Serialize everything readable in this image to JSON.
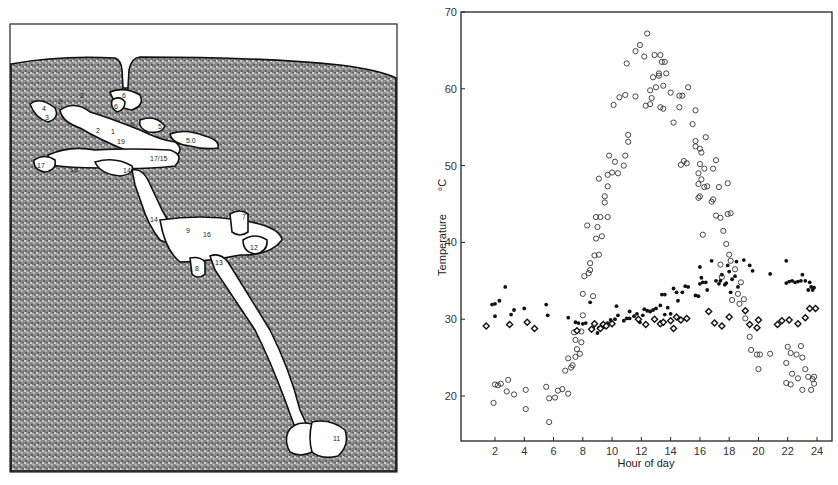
{
  "figure": {
    "left_panel": {
      "type": "burrow-diagram",
      "description": "Cross-section drawing of a burrow/nest system in soil with numbered chambers",
      "chamber_labels": [
        "1",
        "2",
        "2",
        "3",
        "3",
        "4",
        "5",
        "5.0",
        "6",
        "6",
        "6",
        "7",
        "8",
        "9",
        "11",
        "12",
        "13",
        "14",
        "14",
        "16",
        "17",
        "17/15",
        "18",
        "19"
      ]
    },
    "right_panel": {
      "type": "scatter"
    }
  },
  "chart_data": {
    "type": "scatter",
    "title": "",
    "xlabel": "Hour of day",
    "ylabel": "Temperature",
    "ylabel_unit": "°C",
    "xticks": [
      2,
      4,
      6,
      8,
      10,
      12,
      14,
      16,
      18,
      20,
      22,
      24
    ],
    "yticks": [
      20,
      30,
      40,
      50,
      60,
      70
    ],
    "xlim": [
      0.5,
      25
    ],
    "ylim": [
      15,
      70
    ],
    "grid": false,
    "legend": "none",
    "series": [
      {
        "name": "open circles (surface temperature)",
        "marker": "open-circle",
        "points": [
          [
            1.9,
            19.1
          ],
          [
            2.0,
            21.5
          ],
          [
            2.2,
            21.4
          ],
          [
            2.4,
            21.6
          ],
          [
            2.8,
            20.6
          ],
          [
            2.9,
            22.1
          ],
          [
            3.3,
            20.2
          ],
          [
            4.1,
            20.8
          ],
          [
            4.1,
            18.3
          ],
          [
            5.5,
            21.2
          ],
          [
            5.7,
            16.6
          ],
          [
            5.7,
            19.7
          ],
          [
            6.1,
            19.8
          ],
          [
            6.3,
            20.7
          ],
          [
            6.6,
            20.9
          ],
          [
            7.0,
            20.3
          ],
          [
            6.8,
            23.3
          ],
          [
            7.0,
            24.9
          ],
          [
            7.2,
            23.7
          ],
          [
            7.3,
            24.0
          ],
          [
            7.4,
            28.3
          ],
          [
            7.5,
            27.3
          ],
          [
            7.5,
            25.1
          ],
          [
            7.6,
            26.1
          ],
          [
            7.8,
            25.5
          ],
          [
            7.9,
            27.0
          ],
          [
            7.9,
            28.4
          ],
          [
            8.0,
            30.5
          ],
          [
            8.0,
            33.3
          ],
          [
            8.1,
            35.6
          ],
          [
            8.3,
            42.2
          ],
          [
            8.4,
            36.0
          ],
          [
            8.5,
            36.4
          ],
          [
            8.5,
            37.3
          ],
          [
            8.7,
            33.0
          ],
          [
            8.8,
            38.3
          ],
          [
            8.9,
            40.5
          ],
          [
            8.9,
            43.3
          ],
          [
            9.0,
            42.0
          ],
          [
            9.1,
            38.4
          ],
          [
            9.1,
            48.3
          ],
          [
            9.2,
            43.3
          ],
          [
            9.3,
            40.8
          ],
          [
            9.5,
            46.0
          ],
          [
            9.5,
            45.2
          ],
          [
            9.7,
            43.3
          ],
          [
            9.7,
            47.3
          ],
          [
            9.7,
            48.8
          ],
          [
            9.8,
            51.3
          ],
          [
            10.0,
            49.1
          ],
          [
            10.1,
            57.9
          ],
          [
            10.2,
            50.5
          ],
          [
            10.4,
            49.0
          ],
          [
            10.5,
            58.9
          ],
          [
            10.8,
            50.0
          ],
          [
            10.9,
            51.3
          ],
          [
            10.9,
            59.2
          ],
          [
            11.0,
            63.3
          ],
          [
            11.1,
            54.0
          ],
          [
            11.1,
            53.1
          ],
          [
            11.6,
            59.0
          ],
          [
            11.6,
            64.9
          ],
          [
            11.9,
            65.7
          ],
          [
            12.2,
            64.2
          ],
          [
            12.3,
            57.8
          ],
          [
            12.4,
            67.2
          ],
          [
            12.6,
            58.0
          ],
          [
            12.6,
            59.8
          ],
          [
            12.7,
            58.8
          ],
          [
            12.8,
            61.5
          ],
          [
            12.9,
            64.4
          ],
          [
            13.0,
            60.2
          ],
          [
            13.2,
            61.7
          ],
          [
            13.2,
            62.0
          ],
          [
            13.3,
            64.4
          ],
          [
            13.3,
            57.6
          ],
          [
            13.4,
            63.5
          ],
          [
            13.5,
            60.4
          ],
          [
            13.5,
            57.4
          ],
          [
            13.6,
            63.5
          ],
          [
            13.7,
            62.0
          ],
          [
            14.0,
            59.5
          ],
          [
            14.2,
            55.6
          ],
          [
            14.6,
            59.1
          ],
          [
            14.6,
            57.6
          ],
          [
            14.7,
            50.1
          ],
          [
            14.8,
            59.1
          ],
          [
            14.9,
            50.6
          ],
          [
            15.1,
            50.3
          ],
          [
            15.2,
            60.2
          ],
          [
            15.5,
            55.4
          ],
          [
            15.7,
            57.2
          ],
          [
            15.7,
            53.2
          ],
          [
            15.7,
            52.5
          ],
          [
            15.9,
            49.0
          ],
          [
            15.9,
            47.6
          ],
          [
            15.9,
            45.8
          ],
          [
            16.0,
            50.2
          ],
          [
            16.0,
            52.2
          ],
          [
            16.0,
            46.0
          ],
          [
            16.1,
            48.2
          ],
          [
            16.1,
            51.7
          ],
          [
            16.2,
            41.0
          ],
          [
            16.3,
            49.6
          ],
          [
            16.3,
            47.2
          ],
          [
            16.4,
            53.7
          ],
          [
            16.5,
            47.3
          ],
          [
            16.8,
            45.3
          ],
          [
            16.9,
            49.6
          ],
          [
            16.9,
            45.6
          ],
          [
            17.1,
            50.7
          ],
          [
            17.1,
            43.5
          ],
          [
            17.3,
            47.2
          ],
          [
            17.4,
            43.2
          ],
          [
            17.4,
            37.1
          ],
          [
            17.5,
            35.5
          ],
          [
            17.6,
            41.5
          ],
          [
            17.8,
            39.8
          ],
          [
            17.9,
            47.7
          ],
          [
            17.9,
            43.7
          ],
          [
            18.0,
            38.4
          ],
          [
            18.1,
            43.8
          ],
          [
            18.1,
            37.6
          ],
          [
            18.2,
            32.5
          ],
          [
            18.4,
            36.5
          ],
          [
            18.6,
            33.3
          ],
          [
            18.7,
            32.0
          ],
          [
            18.8,
            34.8
          ],
          [
            19.0,
            32.6
          ],
          [
            19.1,
            30.1
          ],
          [
            19.4,
            27.7
          ],
          [
            19.5,
            26.0
          ],
          [
            19.9,
            25.4
          ],
          [
            20.0,
            23.5
          ],
          [
            20.1,
            25.4
          ],
          [
            20.8,
            25.5
          ],
          [
            21.9,
            24.3
          ],
          [
            21.9,
            21.7
          ],
          [
            22.0,
            26.4
          ],
          [
            22.2,
            25.6
          ],
          [
            22.2,
            21.5
          ],
          [
            22.3,
            22.9
          ],
          [
            22.6,
            25.4
          ],
          [
            22.7,
            22.3
          ],
          [
            22.9,
            26.5
          ],
          [
            23.0,
            25.0
          ],
          [
            23.0,
            20.8
          ],
          [
            23.2,
            23.5
          ],
          [
            23.4,
            22.5
          ],
          [
            23.6,
            20.8
          ],
          [
            23.7,
            22.2
          ],
          [
            23.8,
            22.5
          ],
          [
            23.8,
            21.6
          ]
        ]
      },
      {
        "name": "filled dots (burrow temperature, upper)",
        "marker": "filled-dot",
        "points": [
          [
            1.8,
            31.9
          ],
          [
            2.0,
            32.0
          ],
          [
            2.0,
            30.4
          ],
          [
            2.3,
            32.4
          ],
          [
            2.7,
            34.2
          ],
          [
            3.1,
            30.6
          ],
          [
            3.3,
            31.2
          ],
          [
            4.0,
            31.4
          ],
          [
            5.5,
            31.9
          ],
          [
            5.6,
            30.5
          ],
          [
            7.0,
            30.2
          ],
          [
            7.5,
            29.6
          ],
          [
            7.7,
            29.5
          ],
          [
            8.0,
            29.4
          ],
          [
            8.2,
            29.5
          ],
          [
            8.5,
            32.2
          ],
          [
            8.7,
            28.8
          ],
          [
            9.0,
            28.2
          ],
          [
            9.1,
            28.9
          ],
          [
            9.3,
            29.3
          ],
          [
            9.5,
            29.0
          ],
          [
            9.7,
            29.5
          ],
          [
            9.9,
            29.9
          ],
          [
            10.2,
            30.0
          ],
          [
            10.3,
            31.7
          ],
          [
            10.4,
            30.5
          ],
          [
            10.8,
            29.8
          ],
          [
            11.0,
            30.1
          ],
          [
            11.2,
            30.1
          ],
          [
            11.2,
            31.0
          ],
          [
            11.5,
            30.4
          ],
          [
            11.7,
            30.7
          ],
          [
            11.9,
            29.6
          ],
          [
            12.1,
            30.5
          ],
          [
            12.2,
            31.3
          ],
          [
            12.4,
            31.1
          ],
          [
            12.6,
            31.0
          ],
          [
            12.8,
            31.2
          ],
          [
            13.0,
            31.4
          ],
          [
            13.3,
            31.8
          ],
          [
            13.4,
            33.2
          ],
          [
            13.6,
            33.2
          ],
          [
            13.6,
            30.6
          ],
          [
            13.8,
            31.5
          ],
          [
            14.0,
            30.7
          ],
          [
            14.2,
            34.0
          ],
          [
            14.4,
            33.5
          ],
          [
            14.5,
            32.4
          ],
          [
            14.8,
            33.5
          ],
          [
            15.0,
            34.3
          ],
          [
            15.2,
            34.2
          ],
          [
            15.7,
            33.1
          ],
          [
            15.9,
            33.0
          ],
          [
            16.0,
            36.8
          ],
          [
            16.0,
            34.6
          ],
          [
            16.1,
            35.4
          ],
          [
            16.2,
            34.8
          ],
          [
            16.4,
            34.8
          ],
          [
            16.5,
            33.8
          ],
          [
            16.8,
            37.6
          ],
          [
            17.1,
            35.0
          ],
          [
            17.3,
            34.6
          ],
          [
            17.4,
            35.0
          ],
          [
            17.5,
            35.8
          ],
          [
            17.7,
            34.5
          ],
          [
            17.8,
            34.7
          ],
          [
            17.9,
            37.0
          ],
          [
            18.0,
            36.2
          ],
          [
            18.1,
            33.5
          ],
          [
            18.2,
            35.2
          ],
          [
            18.4,
            35.6
          ],
          [
            18.5,
            37.5
          ],
          [
            18.6,
            34.2
          ],
          [
            19.0,
            37.7
          ],
          [
            19.4,
            37.0
          ],
          [
            19.6,
            36.3
          ],
          [
            20.8,
            35.9
          ],
          [
            21.9,
            37.6
          ],
          [
            21.9,
            34.7
          ],
          [
            22.1,
            34.9
          ],
          [
            22.3,
            35.0
          ],
          [
            22.5,
            34.8
          ],
          [
            22.7,
            34.9
          ],
          [
            22.9,
            35.0
          ],
          [
            23.0,
            35.8
          ],
          [
            23.2,
            35.0
          ],
          [
            23.4,
            33.8
          ],
          [
            23.5,
            34.8
          ],
          [
            23.6,
            34.2
          ],
          [
            23.7,
            33.8
          ],
          [
            23.8,
            34.1
          ]
        ]
      },
      {
        "name": "open diamonds/crosses (deep burrow temperature)",
        "marker": "open-diamond",
        "points": [
          [
            1.4,
            29.1
          ],
          [
            3.0,
            29.3
          ],
          [
            4.2,
            29.6
          ],
          [
            4.7,
            28.8
          ],
          [
            7.6,
            28.5
          ],
          [
            8.6,
            28.7
          ],
          [
            8.8,
            29.4
          ],
          [
            9.2,
            28.8
          ],
          [
            9.4,
            29.3
          ],
          [
            9.6,
            29.1
          ],
          [
            10.0,
            29.4
          ],
          [
            11.8,
            30.0
          ],
          [
            12.3,
            29.3
          ],
          [
            12.9,
            30.0
          ],
          [
            13.3,
            29.4
          ],
          [
            13.5,
            29.6
          ],
          [
            14.0,
            29.8
          ],
          [
            14.2,
            28.8
          ],
          [
            14.4,
            30.3
          ],
          [
            14.7,
            29.9
          ],
          [
            15.1,
            30.1
          ],
          [
            16.6,
            31.0
          ],
          [
            17.0,
            29.5
          ],
          [
            17.5,
            29.1
          ],
          [
            18.0,
            30.3
          ],
          [
            19.1,
            31.1
          ],
          [
            19.4,
            29.3
          ],
          [
            19.9,
            28.9
          ],
          [
            20.0,
            29.9
          ],
          [
            21.3,
            29.3
          ],
          [
            21.6,
            29.8
          ],
          [
            22.1,
            29.9
          ],
          [
            22.7,
            29.4
          ],
          [
            23.2,
            30.2
          ],
          [
            23.5,
            31.4
          ],
          [
            23.9,
            31.4
          ]
        ]
      }
    ]
  }
}
